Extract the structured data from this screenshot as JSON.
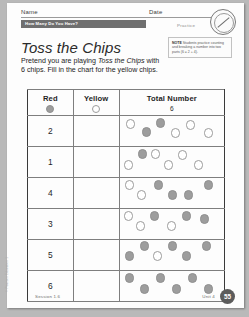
{
  "header": {
    "name_label": "Name",
    "date_label": "Date",
    "banner_title": "How Many Do You Have?",
    "practice_label": "Practice",
    "seal_icon": "pencil-circle-seal-icon"
  },
  "note": {
    "tag": "NOTE",
    "text": "Students practice counting and breaking a number into two parts (6 = 2 + 4)."
  },
  "title": "Toss the Chips",
  "intro": {
    "part1": "Pretend you are playing ",
    "emphasis": "Toss the Chips",
    "part2": " with 6 chips. Fill in the chart for the yellow chips."
  },
  "table": {
    "columns": [
      {
        "label": "Red",
        "chip": "filled-chip-icon"
      },
      {
        "label": "Yellow",
        "chip": "open-chip-icon"
      },
      {
        "label": "Total Number",
        "value": "6"
      }
    ],
    "rows": [
      {
        "red": "2",
        "yellow": "",
        "filled": 2,
        "open": 4
      },
      {
        "red": "1",
        "yellow": "",
        "filled": 1,
        "open": 5
      },
      {
        "red": "4",
        "yellow": "",
        "filled": 4,
        "open": 2
      },
      {
        "red": "3",
        "yellow": "",
        "filled": 3,
        "open": 3
      },
      {
        "red": "5",
        "yellow": "",
        "filled": 5,
        "open": 1
      },
      {
        "red": "6",
        "yellow": "",
        "filled": 6,
        "open": 0
      }
    ]
  },
  "footer": {
    "session": "Session 1.6",
    "unit": "Unit 4",
    "page": "55",
    "copyright": "© Pearson Education 1"
  }
}
